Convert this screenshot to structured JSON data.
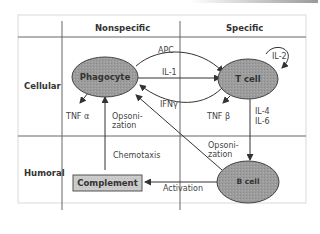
{
  "diagram": {
    "columns": [
      "Nonspecific",
      "Specific"
    ],
    "rows": [
      "Cellular",
      "Humoral"
    ],
    "nodes": {
      "phagocyte": "Phagocyte",
      "tcell": "T cell",
      "bcell": "B cell",
      "complement": "Complement"
    },
    "edges": {
      "apc": "APC",
      "il1": "IL-1",
      "ifng": "IFNγ",
      "il2": "IL-2",
      "tnfa": "TNF α",
      "tnfb": "TNF β",
      "il4": "IL-4",
      "il6": "IL-6",
      "opsonization_phagocyte": "Opsoni-\nzation",
      "opsonization_bcell": "Opsoni-\nzation",
      "chemotaxis": "Chemotaxis",
      "activation": "Activation"
    },
    "colors": {
      "cell_fill": "#9a9a9a",
      "complement_fill": "#c8c8c8",
      "line": "#444444",
      "grid": "#555555",
      "frame": "#d8d8d8"
    }
  }
}
